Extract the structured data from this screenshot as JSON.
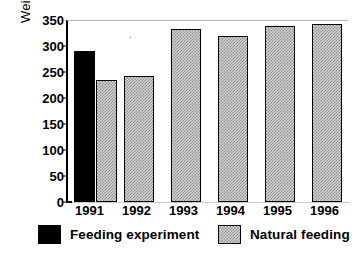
{
  "chart_data": {
    "type": "bar",
    "title": "",
    "xlabel": "",
    "ylabel": "Weight (g)",
    "ylim": [
      0,
      350
    ],
    "yticks": [
      0,
      50,
      100,
      150,
      200,
      250,
      300,
      350
    ],
    "categories": [
      "1991",
      "1992",
      "1993",
      "1994",
      "1995",
      "1996"
    ],
    "grid": false,
    "legend_position": "bottom",
    "series": [
      {
        "name": "Feeding experiment",
        "color": "#000000",
        "fill": "solid-black",
        "values": [
          290,
          null,
          null,
          null,
          null,
          null
        ]
      },
      {
        "name": "Natural feeding",
        "color": "#d2d2d2",
        "fill": "checkered-gray",
        "values": [
          235,
          242,
          333,
          319,
          338,
          343
        ]
      }
    ]
  },
  "axis": {
    "y_title": "Weight (g)",
    "y_tick_labels": [
      "350",
      "300",
      "250",
      "200",
      "150",
      "100",
      "50",
      "0"
    ],
    "x_tick_labels": [
      "1991",
      "1992",
      "1993",
      "1994",
      "1995",
      "1996"
    ]
  },
  "legend": {
    "items": [
      {
        "label": "Feeding experiment",
        "swatch": "black"
      },
      {
        "label": "Natural feeding",
        "swatch": "gray"
      }
    ]
  }
}
